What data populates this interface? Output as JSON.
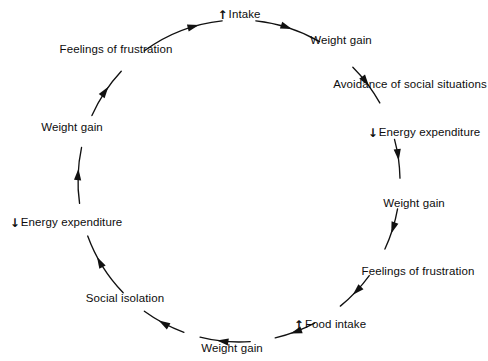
{
  "figure": {
    "type": "cycle-diagram",
    "shape": "circle",
    "direction": "clockwise",
    "stroke_color": "#111111",
    "background_color": "#ffffff",
    "center": {
      "x": 239,
      "y": 181
    },
    "radius": 161
  },
  "glyphs": {
    "up": "↑",
    "down": "↓"
  },
  "nodes": [
    {
      "id": "intake",
      "text": "Intake",
      "prefix": "up",
      "angle_deg": -90,
      "x": 239,
      "y": 14,
      "anchor": "center"
    },
    {
      "id": "weight-gain-1",
      "text": "Weight gain",
      "prefix": "",
      "angle_deg": -52,
      "x": 341,
      "y": 40,
      "anchor": "center"
    },
    {
      "id": "avoidance-of-social-situations",
      "text": "Avoidance of social situations",
      "prefix": "",
      "angle_deg": -22,
      "x": 410,
      "y": 84,
      "anchor": "center"
    },
    {
      "id": "energy-expenditure-1",
      "text": "Energy expenditure",
      "prefix": "down",
      "angle_deg": 4,
      "x": 424,
      "y": 132,
      "anchor": "center"
    },
    {
      "id": "weight-gain-2",
      "text": "Weight gain",
      "prefix": "",
      "angle_deg": 30,
      "x": 414,
      "y": 203,
      "anchor": "center"
    },
    {
      "id": "feelings-of-frustration-1",
      "text": "Feelings of frustration",
      "prefix": "",
      "angle_deg": 56,
      "x": 418,
      "y": 271,
      "anchor": "center"
    },
    {
      "id": "food-intake",
      "text": "Food intake",
      "prefix": "up",
      "angle_deg": 80,
      "x": 330,
      "y": 324,
      "anchor": "center"
    },
    {
      "id": "weight-gain-3",
      "text": "Weight gain",
      "prefix": "",
      "angle_deg": 100,
      "x": 232,
      "y": 348,
      "anchor": "center"
    },
    {
      "id": "social-isolation",
      "text": "Social isolation",
      "prefix": "",
      "angle_deg": 130,
      "x": 125,
      "y": 298,
      "anchor": "center"
    },
    {
      "id": "energy-expenditure-2",
      "text": "Energy expenditure",
      "prefix": "down",
      "angle_deg": 165,
      "x": 66,
      "y": 222,
      "anchor": "center"
    },
    {
      "id": "weight-gain-4",
      "text": "Weight gain",
      "prefix": "",
      "angle_deg": 198,
      "x": 72,
      "y": 127,
      "anchor": "center"
    },
    {
      "id": "feelings-of-frustration-2",
      "text": "Feelings of frustration",
      "prefix": "",
      "angle_deg": 228,
      "x": 116,
      "y": 49,
      "anchor": "center"
    }
  ],
  "arcs": [
    {
      "id": "arc-intake-to-weight-gain-1",
      "start_deg": -84,
      "end_deg": -60,
      "arrow_at": 0.55
    },
    {
      "id": "arc-weight-gain-1-to-avoidance",
      "start_deg": -45,
      "end_deg": -29,
      "arrow_at": 0.55
    },
    {
      "id": "arc-avoidance-to-energy-expenditure-1",
      "start_deg": -15,
      "end_deg": -1,
      "arrow_at": 0.55
    },
    {
      "id": "arc-energy-expenditure-1-to-weight-gain-2",
      "start_deg": 10,
      "end_deg": 25,
      "arrow_at": 0.6
    },
    {
      "id": "arc-weight-gain-2-to-feelings-1",
      "start_deg": 36,
      "end_deg": 51,
      "arrow_at": 0.6
    },
    {
      "id": "arc-feelings-1-to-food-intake",
      "start_deg": 62,
      "end_deg": 77,
      "arrow_at": 0.62
    },
    {
      "id": "arc-food-intake-to-weight-gain-3",
      "start_deg": 86,
      "end_deg": 104,
      "arrow_at": 0.66
    },
    {
      "id": "arc-weight-gain-3-to-social-isolation",
      "start_deg": 110,
      "end_deg": 126,
      "arrow_at": 0.62
    },
    {
      "id": "arc-social-isolation-to-energy-exp-2",
      "start_deg": 136,
      "end_deg": 160,
      "arrow_at": 0.66
    },
    {
      "id": "arc-energy-exp-2-to-weight-gain-4",
      "start_deg": 172,
      "end_deg": 192,
      "arrow_at": 0.62
    },
    {
      "id": "arc-weight-gain-4-to-feelings-2",
      "start_deg": 204,
      "end_deg": 223,
      "arrow_at": 0.62
    },
    {
      "id": "arc-feelings-2-to-intake",
      "start_deg": 234,
      "end_deg": 264,
      "arrow_at": 0.72
    }
  ]
}
